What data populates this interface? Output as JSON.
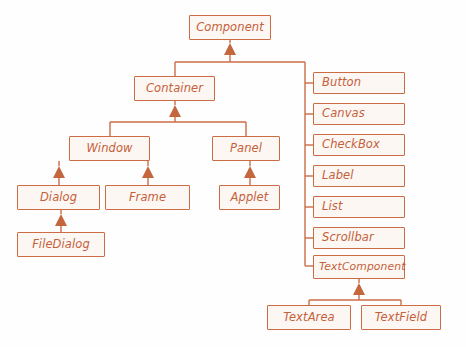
{
  "diagram": {
    "type": "uml-class-hierarchy",
    "colors": {
      "border": "#cb6c45",
      "fill": "#fdf7f3",
      "text": "#c4603a",
      "connector": "#cb6c45",
      "background": "#fefefe"
    },
    "nodes": [
      {
        "id": "component",
        "label": "Component",
        "x": 189,
        "y": 15,
        "w": 82,
        "h": 25
      },
      {
        "id": "container",
        "label": "Container",
        "x": 134,
        "y": 76,
        "w": 81,
        "h": 25
      },
      {
        "id": "window",
        "label": "Window",
        "x": 69,
        "y": 136,
        "w": 81,
        "h": 25
      },
      {
        "id": "panel",
        "label": "Panel",
        "x": 212,
        "y": 136,
        "w": 68,
        "h": 25
      },
      {
        "id": "dialog",
        "label": "Dialog",
        "x": 17,
        "y": 185,
        "w": 83,
        "h": 25
      },
      {
        "id": "frame",
        "label": "Frame",
        "x": 105,
        "y": 185,
        "w": 85,
        "h": 25
      },
      {
        "id": "applet",
        "label": "Applet",
        "x": 219,
        "y": 185,
        "w": 61,
        "h": 25
      },
      {
        "id": "filedialog",
        "label": "FileDialog",
        "x": 17,
        "y": 232,
        "w": 88,
        "h": 25
      },
      {
        "id": "button",
        "label": "Button",
        "x": 313,
        "y": 72,
        "w": 92,
        "h": 22
      },
      {
        "id": "canvas",
        "label": "Canvas",
        "x": 313,
        "y": 103,
        "w": 92,
        "h": 22
      },
      {
        "id": "checkbox",
        "label": "CheckBox",
        "x": 313,
        "y": 134,
        "w": 92,
        "h": 22
      },
      {
        "id": "label",
        "label": "Label",
        "x": 313,
        "y": 165,
        "w": 92,
        "h": 22
      },
      {
        "id": "list",
        "label": "List",
        "x": 313,
        "y": 196,
        "w": 92,
        "h": 22
      },
      {
        "id": "scrollbar",
        "label": "Scrollbar",
        "x": 313,
        "y": 227,
        "w": 92,
        "h": 22
      },
      {
        "id": "textcomponent",
        "label": "TextComponent",
        "x": 313,
        "y": 255,
        "w": 92,
        "h": 24
      },
      {
        "id": "textarea",
        "label": "TextArea",
        "x": 267,
        "y": 305,
        "w": 84,
        "h": 25
      },
      {
        "id": "textfield",
        "label": "TextField",
        "x": 361,
        "y": 305,
        "w": 80,
        "h": 25
      }
    ],
    "edges": [
      {
        "from": "container",
        "to": "component",
        "kind": "generalization"
      },
      {
        "from": "window",
        "to": "container",
        "kind": "generalization"
      },
      {
        "from": "panel",
        "to": "container",
        "kind": "generalization"
      },
      {
        "from": "dialog",
        "to": "window",
        "kind": "generalization"
      },
      {
        "from": "frame",
        "to": "window",
        "kind": "generalization"
      },
      {
        "from": "filedialog",
        "to": "dialog",
        "kind": "generalization"
      },
      {
        "from": "applet",
        "to": "panel",
        "kind": "generalization"
      },
      {
        "from": "button",
        "to": "component",
        "kind": "generalization"
      },
      {
        "from": "canvas",
        "to": "component",
        "kind": "generalization"
      },
      {
        "from": "checkbox",
        "to": "component",
        "kind": "generalization"
      },
      {
        "from": "label",
        "to": "component",
        "kind": "generalization"
      },
      {
        "from": "list",
        "to": "component",
        "kind": "generalization"
      },
      {
        "from": "scrollbar",
        "to": "component",
        "kind": "generalization"
      },
      {
        "from": "textcomponent",
        "to": "component",
        "kind": "generalization"
      },
      {
        "from": "textarea",
        "to": "textcomponent",
        "kind": "generalization"
      },
      {
        "from": "textfield",
        "to": "textcomponent",
        "kind": "generalization"
      }
    ]
  }
}
